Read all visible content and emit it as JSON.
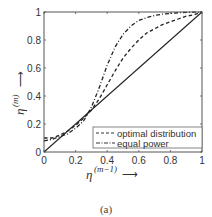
{
  "chart_data": {
    "type": "line",
    "title": "",
    "caption": "(a)",
    "xlabel": "η^(m−1) →",
    "ylabel": "η^(m) →",
    "xlim": [
      0,
      1
    ],
    "ylim": [
      0,
      1
    ],
    "x_ticks": [
      "0",
      "0.2",
      "0.4",
      "0.6",
      "0.8",
      "1"
    ],
    "y_ticks": [
      "0",
      "0.2",
      "0.4",
      "0.6",
      "0.8",
      "1"
    ],
    "grid": false,
    "legend_position": "lower right",
    "series": [
      {
        "name": "reference (y = x)",
        "style": "solid",
        "in_legend": false,
        "x": [
          0,
          1
        ],
        "y": [
          0,
          1
        ]
      },
      {
        "name": "optimal distribution",
        "style": "dashed",
        "in_legend": true,
        "x": [
          0,
          0.05,
          0.1,
          0.15,
          0.2,
          0.25,
          0.3,
          0.35,
          0.4,
          0.45,
          0.5,
          0.55,
          0.6,
          0.65,
          0.7,
          0.75,
          0.8,
          0.85,
          0.9,
          0.95,
          1
        ],
        "y": [
          0.1,
          0.1,
          0.12,
          0.15,
          0.19,
          0.24,
          0.3,
          0.38,
          0.48,
          0.58,
          0.67,
          0.74,
          0.8,
          0.85,
          0.88,
          0.91,
          0.93,
          0.95,
          0.97,
          0.98,
          1.0
        ]
      },
      {
        "name": "equal power",
        "style": "dashdot",
        "in_legend": true,
        "x": [
          0,
          0.05,
          0.1,
          0.15,
          0.2,
          0.25,
          0.3,
          0.35,
          0.4,
          0.45,
          0.5,
          0.55,
          0.6,
          0.65,
          0.7,
          0.75,
          0.8,
          0.85,
          0.9,
          0.95,
          1
        ],
        "y": [
          0.08,
          0.09,
          0.11,
          0.13,
          0.17,
          0.22,
          0.32,
          0.46,
          0.62,
          0.75,
          0.84,
          0.9,
          0.94,
          0.96,
          0.975,
          0.985,
          0.99,
          0.995,
          0.997,
          0.999,
          1.0
        ]
      }
    ]
  },
  "labels": {
    "caption": "(a)",
    "legend_optimal": "optimal distribution",
    "legend_equal": "equal power",
    "xlabel_base": "η",
    "xlabel_sup": "(m−1)",
    "ylabel_base": "η",
    "ylabel_sup": "(m)",
    "arrow": "⟶"
  }
}
